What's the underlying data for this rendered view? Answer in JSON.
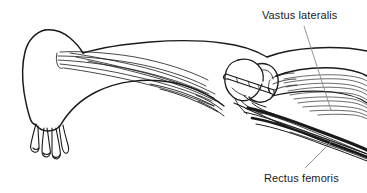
{
  "figure": {
    "name": "rat-hindlimb-lateral-anatomy",
    "background_color": "#ffffff",
    "ink_color": "#1a1a1a",
    "leader_line_color": "#8a8a8a",
    "width": 367,
    "height": 193
  },
  "labels": [
    {
      "id": "vastus-lateralis",
      "text": "Vastus lateralis",
      "x": 262,
      "y": 10,
      "leader": {
        "x1": 304,
        "y1": 26,
        "x2": 331,
        "y2": 110
      }
    },
    {
      "id": "rectus-femoris",
      "text": "Rectus femoris",
      "x": 264,
      "y": 173,
      "leader": {
        "x1": 305,
        "y1": 168,
        "x2": 333,
        "y2": 140
      }
    }
  ],
  "structures": {
    "foot": "paw-with-four-digits",
    "joint": "knee-with-patella",
    "instrument": "needle-electrode",
    "muscles": [
      "vastus lateralis",
      "rectus femoris"
    ]
  }
}
